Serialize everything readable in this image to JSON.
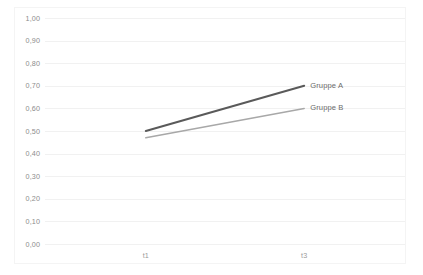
{
  "chart_data": {
    "type": "line",
    "title": "",
    "xlabel": "",
    "ylabel": "",
    "categories": [
      "t1",
      "t3"
    ],
    "x": [
      0,
      1
    ],
    "xlim": [
      0,
      1
    ],
    "ylim": [
      0.0,
      1.0
    ],
    "ytick_step": 0.1,
    "grid": true,
    "legend_position": "right-inline-end-of-line",
    "decimal_separator": ",",
    "ytick_labels": [
      "1,00",
      "0,90",
      "0,80",
      "0,70",
      "0,60",
      "0,50",
      "0,40",
      "0,30",
      "0,20",
      "0,10",
      "0,00"
    ],
    "ytick_values": [
      1.0,
      0.9,
      0.8,
      0.7,
      0.6,
      0.5,
      0.4,
      0.3,
      0.2,
      0.1,
      0.0
    ],
    "xtick_labels": [
      "t1",
      "t3"
    ],
    "series": [
      {
        "name": "Gruppe A",
        "values": [
          0.5,
          0.7
        ],
        "color": "#5a5a5a",
        "width": 2.0
      },
      {
        "name": "Gruppe B",
        "values": [
          0.47,
          0.6
        ],
        "color": "#a8a8a8",
        "width": 1.5
      }
    ]
  },
  "colors": {
    "background": "#ffffff",
    "gridline": "#f1f1f1",
    "panel_border": "#f4f4f4",
    "axis_text": "#8c8c8c",
    "legend_text": "#6b6b6b",
    "series_a": "#5a5a5a",
    "series_b": "#a8a8a8"
  }
}
